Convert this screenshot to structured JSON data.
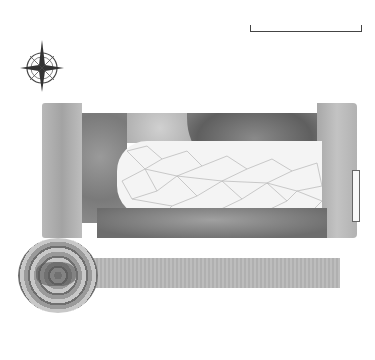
{
  "diagram": {
    "type": "garden-plan",
    "scale": {
      "label": "10ft/3m"
    },
    "compass": {
      "icon": "compass-rose-icon"
    },
    "area_marker": "A",
    "top_labels": [
      {
        "text": "5",
        "x": 93
      },
      {
        "text": "7",
        "x": 118
      },
      {
        "text": "22",
        "x": 166
      },
      {
        "text": "8",
        "x": 188
      },
      {
        "text": "12",
        "x": 213
      },
      {
        "text": "21",
        "x": 236
      },
      {
        "text": "13",
        "x": 265
      },
      {
        "text": "4",
        "x": 290
      },
      {
        "text": "1",
        "x": 343
      }
    ],
    "left_labels": [
      {
        "text": "2",
        "y": 118
      },
      {
        "text": "10",
        "y": 140
      },
      {
        "text": "20",
        "y": 158
      },
      {
        "text": "9",
        "y": 180
      },
      {
        "text": "11",
        "y": 198
      }
    ],
    "bottom_labels": [
      {
        "text": "3",
        "x": 60
      },
      {
        "text": "6",
        "x": 110
      },
      {
        "text": "17",
        "x": 143
      },
      {
        "text": "19",
        "x": 171
      },
      {
        "text": "15",
        "x": 200
      },
      {
        "text": "20",
        "x": 227
      },
      {
        "text": "14",
        "x": 258
      },
      {
        "text": "18",
        "x": 281
      },
      {
        "text": "16",
        "x": 307
      },
      {
        "text": "2",
        "x": 341
      }
    ],
    "colors": {
      "background": "#ffffff",
      "ink": "#333333",
      "paving": "#f4f4f4",
      "planting_dark": "#5f5f5f",
      "planting_light": "#b8b8b8"
    }
  }
}
